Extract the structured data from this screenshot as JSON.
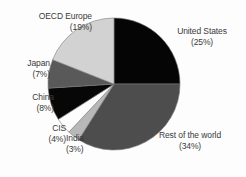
{
  "chart_data": {
    "type": "pie",
    "title": "",
    "subtitle": "",
    "xlabel": "",
    "ylabel": "",
    "legend_position": "none",
    "grid": false,
    "units": "percent",
    "start_angle_deg": 0,
    "direction": "clockwise",
    "categories": [
      "United States",
      "Rest of the world",
      "India",
      "CIS",
      "China",
      "Japan",
      "OECD Europe"
    ],
    "values": [
      25,
      34,
      3,
      4,
      8,
      7,
      19
    ],
    "colors": [
      "#050505",
      "#4d4d4d",
      "#b8b8b8",
      "#fcfcfc",
      "#070707",
      "#595959",
      "#d2d2d2"
    ],
    "slices": [
      {
        "label": "United States",
        "value": 25,
        "value_text": "(25%)",
        "color": "#050505"
      },
      {
        "label": "Rest of the world",
        "value": 34,
        "value_text": "(34%)",
        "color": "#4d4d4d"
      },
      {
        "label": "India",
        "value": 3,
        "value_text": "(3%)",
        "color": "#b8b8b8"
      },
      {
        "label": "CIS",
        "value": 4,
        "value_text": "(4%)",
        "color": "#fcfcfc"
      },
      {
        "label": "China",
        "value": 8,
        "value_text": "(8%)",
        "color": "#070707"
      },
      {
        "label": "Japan",
        "value": 7,
        "value_text": "(7%)",
        "color": "#595959"
      },
      {
        "label": "OECD Europe",
        "value": 19,
        "value_text": "(19%)",
        "color": "#d2d2d2"
      }
    ]
  },
  "geometry": {
    "center_x": 114,
    "center_y": 84,
    "radius": 66,
    "stroke_color": "#7a7a7a",
    "stroke_width": 0.6
  },
  "labels": {
    "oecd_europe": {
      "name": "OECD Europe",
      "pct": "(19%)"
    },
    "japan": {
      "name": "Japan",
      "pct": "(7%)"
    },
    "china": {
      "name": "China",
      "pct": "(8%)"
    },
    "cis": {
      "name": "CIS",
      "pct": "(4%)"
    },
    "india": {
      "name": "India",
      "pct": "(3%)"
    },
    "rest_of_the_world": {
      "name": "Rest of the world",
      "pct": "(34%)"
    },
    "united_states": {
      "name": "United States",
      "pct": "(25%)"
    }
  }
}
